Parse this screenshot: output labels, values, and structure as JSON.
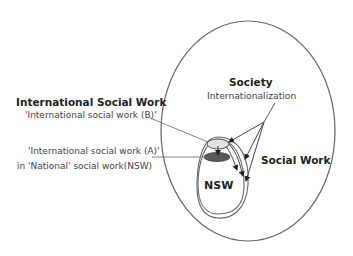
{
  "diagram": {
    "labels": {
      "international_social_work": "International Social Work",
      "isw_b": "'International social work (B)'",
      "isw_a": "'International social work (A)'",
      "isw_a_line2": "in 'National' social work(NSW)",
      "society": "Society",
      "internationalization": "Internationalization",
      "social_work": "Social Work",
      "nsw": "NSW"
    },
    "colors": {
      "stroke": "#555555",
      "light_ellipse_fill": "#e2e2e2",
      "dark_ellipse_fill": "#5a5a5a",
      "text": "#222222"
    },
    "shapes": {
      "society_ellipse": {
        "cx": 248,
        "cy": 131,
        "rx": 87,
        "ry": 110
      },
      "isw_b_ellipse": {
        "cx": 218,
        "cy": 144,
        "rx": 11,
        "ry": 5
      },
      "isw_a_ellipse": {
        "cx": 217,
        "cy": 157,
        "rx": 13,
        "ry": 4.5
      }
    }
  }
}
